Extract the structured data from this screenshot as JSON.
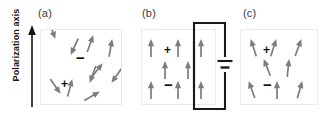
{
  "figure": {
    "axis_label": "Polarization axis",
    "background_color": "#ffffff",
    "arrow_color": "#7d7d7d",
    "sign_color": "#0f0f0f",
    "box_border_color": "#eceaea",
    "circuit_color": "#1a1a1a",
    "axis_color": "#111111"
  },
  "panels": [
    {
      "label": "(a)",
      "name": "panel-a-random-dipoles",
      "signs": [
        {
          "symbol": "+",
          "x": 20,
          "y": 48
        },
        {
          "symbol": "−",
          "x": 35,
          "y": 20
        }
      ],
      "arrows": [
        {
          "x": 14,
          "y": 8,
          "angle": 160
        },
        {
          "x": 52,
          "y": 6,
          "angle": 20
        },
        {
          "x": 71,
          "y": 10,
          "angle": 10
        },
        {
          "x": 30,
          "y": 24,
          "angle": 205
        },
        {
          "x": 61,
          "y": 34,
          "angle": 38
        },
        {
          "x": 31,
          "y": 50,
          "angle": 15
        },
        {
          "x": 49,
          "y": 52,
          "angle": 200
        },
        {
          "x": 71,
          "y": 52,
          "angle": 215
        },
        {
          "x": 19,
          "y": 63,
          "angle": 145
        },
        {
          "x": 58,
          "y": 62,
          "angle": 60
        }
      ]
    },
    {
      "label": "(b)",
      "name": "panel-b-aligned-dipoles",
      "signs": [
        {
          "symbol": "+",
          "x": 22,
          "y": 14
        },
        {
          "symbol": "−",
          "x": 22,
          "y": 47
        }
      ],
      "arrows": [
        {
          "x": 9,
          "y": 10,
          "angle": 0
        },
        {
          "x": 36,
          "y": 10,
          "angle": 0
        },
        {
          "x": 59,
          "y": 10,
          "angle": 0
        },
        {
          "x": 23,
          "y": 32,
          "angle": 0
        },
        {
          "x": 46,
          "y": 32,
          "angle": 0
        },
        {
          "x": 9,
          "y": 52,
          "angle": 0
        },
        {
          "x": 36,
          "y": 52,
          "angle": 0
        },
        {
          "x": 59,
          "y": 52,
          "angle": 0
        }
      ]
    },
    {
      "label": "(c)",
      "name": "panel-c-remanent-polarization",
      "signs": [
        {
          "symbol": "+",
          "x": 22,
          "y": 14
        },
        {
          "symbol": "−",
          "x": 22,
          "y": 47
        }
      ],
      "arrows": [
        {
          "x": 10,
          "y": 10,
          "angle": -18
        },
        {
          "x": 35,
          "y": 10,
          "angle": 18
        },
        {
          "x": 60,
          "y": 10,
          "angle": 20
        },
        {
          "x": 23,
          "y": 30,
          "angle": -22
        },
        {
          "x": 48,
          "y": 30,
          "angle": 6
        },
        {
          "x": 8,
          "y": 52,
          "angle": -20
        },
        {
          "x": 36,
          "y": 52,
          "angle": 0
        },
        {
          "x": 61,
          "y": 52,
          "angle": 16
        }
      ]
    }
  ],
  "circuit": {
    "name": "voltage-source-circuit",
    "battery_symbol": "battery",
    "description": "external voltage source connected across panel b"
  }
}
